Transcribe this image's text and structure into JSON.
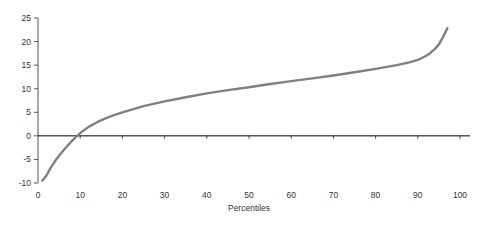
{
  "chart_data": {
    "type": "line",
    "title": "",
    "subtitle": "",
    "xlabel": "Percentiles",
    "ylabel": "",
    "xlim": [
      0,
      100
    ],
    "ylim": [
      -10,
      25
    ],
    "grid": false,
    "legend": false,
    "legend_position": "none",
    "series_color": "#808080",
    "zero_line": true,
    "zero_line_color": "#000000",
    "xticks": [
      0,
      10,
      20,
      30,
      40,
      50,
      60,
      70,
      80,
      90,
      100
    ],
    "xtick_labels": [
      "0",
      "10",
      "20",
      "30",
      "40",
      "50",
      "60",
      "70",
      "80",
      "90",
      "100"
    ],
    "yticks": [
      -10,
      -5,
      0,
      5,
      10,
      15,
      20,
      25
    ],
    "ytick_labels": [
      "-10",
      "-5",
      "0",
      "5",
      "10",
      "15",
      "20",
      "25"
    ],
    "series": [
      {
        "name": "percentile-curve",
        "x": [
          1,
          2,
          3,
          4,
          5,
          6,
          7,
          8,
          9,
          10,
          12,
          14,
          16,
          18,
          20,
          25,
          30,
          35,
          40,
          45,
          50,
          55,
          60,
          65,
          70,
          75,
          80,
          85,
          88,
          90,
          92,
          93,
          94,
          95,
          96,
          97
        ],
        "values": [
          -9.5,
          -8.4,
          -6.8,
          -5.4,
          -4.2,
          -3.1,
          -2.1,
          -1.1,
          -0.2,
          0.6,
          1.9,
          2.9,
          3.7,
          4.4,
          5.0,
          6.3,
          7.3,
          8.2,
          9.0,
          9.7,
          10.3,
          11.0,
          11.6,
          12.2,
          12.8,
          13.5,
          14.2,
          15.0,
          15.6,
          16.1,
          17.0,
          17.6,
          18.4,
          19.4,
          21.0,
          22.8
        ]
      }
    ]
  },
  "axis": {
    "x_title": "Percentiles"
  }
}
